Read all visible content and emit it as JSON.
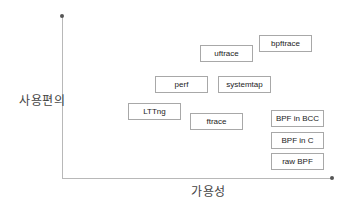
{
  "axes": {
    "y_label": "사용편의",
    "x_label": "가용성"
  },
  "tools": [
    {
      "name": "uftrace",
      "left": 200,
      "top": 45
    },
    {
      "name": "bpftrace",
      "left": 259,
      "top": 35
    },
    {
      "name": "perf",
      "left": 155,
      "top": 76
    },
    {
      "name": "systemtap",
      "left": 218,
      "top": 76
    },
    {
      "name": "LTTng",
      "left": 128,
      "top": 103
    },
    {
      "name": "ftrace",
      "left": 190,
      "top": 113
    },
    {
      "name": "BPF in BCC",
      "left": 271,
      "top": 110
    },
    {
      "name": "BPF in C",
      "left": 271,
      "top": 132
    },
    {
      "name": "raw BPF",
      "left": 271,
      "top": 153
    }
  ]
}
